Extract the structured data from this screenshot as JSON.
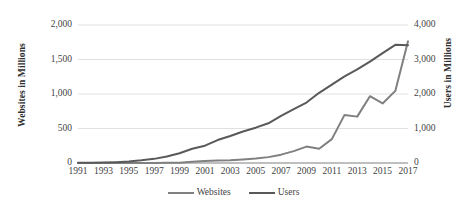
{
  "chart_data": {
    "type": "line",
    "title": "",
    "xlabel": "",
    "grid": "horizontal",
    "legend_position": "bottom",
    "x": [
      1991,
      1992,
      1993,
      1994,
      1995,
      1996,
      1997,
      1998,
      1999,
      2000,
      2001,
      2002,
      2003,
      2004,
      2005,
      2006,
      2007,
      2008,
      2009,
      2010,
      2011,
      2012,
      2013,
      2014,
      2015,
      2016,
      2017
    ],
    "x_tick_labels": [
      "1991",
      "1993",
      "1995",
      "1997",
      "1999",
      "2001",
      "2003",
      "2005",
      "2007",
      "2009",
      "2011",
      "2013",
      "2015",
      "2017"
    ],
    "axes": {
      "left": {
        "label": "Websites in Millions",
        "ylim": [
          0,
          2000
        ],
        "ticks": [
          0,
          500,
          1000,
          1500,
          2000
        ],
        "tick_labels": [
          "0",
          "500",
          "1,000",
          "1,500",
          "2,000"
        ]
      },
      "right": {
        "label": "Users in Millions",
        "ylim": [
          0,
          4000
        ],
        "ticks": [
          0,
          1000,
          2000,
          3000,
          4000
        ],
        "tick_labels": [
          "0",
          "1,000",
          "2,000",
          "3,000",
          "4,000"
        ]
      }
    },
    "series": [
      {
        "name": "Websites",
        "axis": "left",
        "color": "#808080",
        "units": "millions",
        "values": [
          0,
          0,
          0,
          0,
          0,
          0.3,
          1,
          2,
          3,
          17,
          29,
          38,
          40,
          51,
          64,
          85,
          121,
          172,
          238,
          207,
          346,
          697,
          672,
          968,
          863,
          1045,
          1766
        ]
      },
      {
        "name": "Users",
        "axis": "right",
        "color": "#595959",
        "units": "millions",
        "values": [
          4,
          8,
          14,
          25,
          44,
          77,
          120,
          188,
          281,
          414,
          502,
          665,
          781,
          913,
          1024,
          1151,
          1366,
          1562,
          1752,
          2034,
          2272,
          2511,
          2712,
          2937,
          3185,
          3424,
          3412
        ]
      }
    ]
  },
  "legend": {
    "items": [
      {
        "label": "Websites",
        "color": "#808080"
      },
      {
        "label": "Users",
        "color": "#595959"
      }
    ]
  },
  "style": {
    "gridline_color": "#d9d9d9",
    "baseline_color": "#808080",
    "background": "#ffffff",
    "text_color": "#3f3f3f"
  }
}
